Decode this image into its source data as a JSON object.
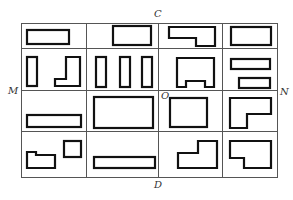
{
  "diagram": {
    "labels": {
      "top": "C",
      "bottom": "D",
      "left": "M",
      "right": "N",
      "center": "O"
    },
    "grid": {
      "rows": 4,
      "columns": 4
    },
    "buildings": [
      {
        "cell": "r1c1",
        "shape": "rectangle"
      },
      {
        "cell": "r1c2",
        "shape": "rectangle"
      },
      {
        "cell": "r1c3",
        "shape": "L-shape"
      },
      {
        "cell": "r1c4",
        "shape": "rectangle"
      },
      {
        "cell": "r2c1",
        "shape": "tall-rectangle"
      },
      {
        "cell": "r2c1",
        "shape": "L-shape"
      },
      {
        "cell": "r2c2",
        "shape": "tall-rectangle"
      },
      {
        "cell": "r2c2",
        "shape": "tall-rectangle"
      },
      {
        "cell": "r2c2",
        "shape": "tall-rectangle"
      },
      {
        "cell": "r2c3",
        "shape": "notched-rectangle"
      },
      {
        "cell": "r2c4",
        "shape": "rectangle"
      },
      {
        "cell": "r2c4",
        "shape": "rectangle"
      },
      {
        "cell": "r3c1",
        "shape": "rectangle"
      },
      {
        "cell": "r3c2",
        "shape": "rectangle"
      },
      {
        "cell": "r3c3",
        "shape": "square"
      },
      {
        "cell": "r3c4",
        "shape": "L-shape"
      },
      {
        "cell": "r4c1",
        "shape": "stepped-shape"
      },
      {
        "cell": "r4c1",
        "shape": "square"
      },
      {
        "cell": "r4c2",
        "shape": "rectangle"
      },
      {
        "cell": "r4c3",
        "shape": "L-shape"
      },
      {
        "cell": "r4c4",
        "shape": "stepped-shape"
      }
    ]
  }
}
